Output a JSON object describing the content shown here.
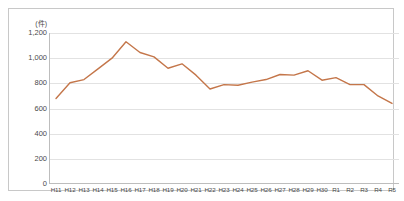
{
  "chart_data": {
    "type": "line",
    "title": "",
    "subtitle": "",
    "xlabel": "",
    "ylabel": "",
    "unit_label": "(件)",
    "grid": true,
    "legend": null,
    "ylim": [
      0,
      1200
    ],
    "yticks": [
      0,
      200,
      400,
      600,
      800,
      1000,
      1200
    ],
    "ytick_labels": [
      "0",
      "200",
      "400",
      "600",
      "800",
      "1,000",
      "1,200"
    ],
    "categories": [
      "H11",
      "H12",
      "H13",
      "H14",
      "H15",
      "H16",
      "H17",
      "H18",
      "H19",
      "H20",
      "H21",
      "H22",
      "H23",
      "H24",
      "H25",
      "H26",
      "H27",
      "H28",
      "H29",
      "H30",
      "R1",
      "R2",
      "R3",
      "R4",
      "R5"
    ],
    "series": [
      {
        "name": "件数",
        "color": "#C4764A",
        "values": [
          680,
          805,
          830,
          915,
          1000,
          1130,
          1045,
          1010,
          920,
          955,
          865,
          755,
          790,
          785,
          810,
          830,
          870,
          865,
          900,
          825,
          845,
          790,
          790,
          700,
          640
        ]
      }
    ]
  },
  "axis": {
    "unit": "(件)"
  },
  "style": {
    "line_color": "#C4764A",
    "grid_color": "#E2E2E2",
    "axis_color": "#BDBDBD",
    "frame_color": "#C8C8C8",
    "text_color": "#4A4A4A",
    "background": "#FFFFFF"
  }
}
